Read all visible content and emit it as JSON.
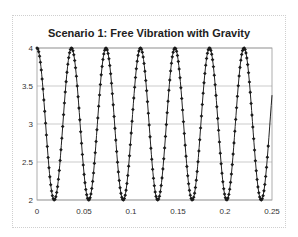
{
  "chart_data": {
    "type": "line",
    "title": "Scenario 1: Free Vibration with Gravity",
    "xlabel": "",
    "ylabel": "",
    "xlim": [
      0,
      0.25
    ],
    "ylim": [
      2,
      4
    ],
    "x_ticks": [
      "0",
      "0.05",
      "0.1",
      "0.15",
      "0.2",
      "0.25"
    ],
    "y_ticks": [
      "2",
      "2.5",
      "3",
      "3.5",
      "4"
    ],
    "grid": {
      "horizontal": true,
      "vertical": false
    },
    "legend": null,
    "series": [
      {
        "name": "displacement",
        "marker": "diamond",
        "color": "#1a1a1a",
        "model": "y = 3 + cos(2*pi*t/T)",
        "mean": 3,
        "amplitude": 1,
        "period": 0.0367,
        "t_start": 0,
        "t_end": 0.25,
        "y_at_end": 3.68,
        "peaks_t": [
          0,
          0.0367,
          0.0734,
          0.1101,
          0.1468,
          0.1835,
          0.2202
        ],
        "troughs_t": [
          0.0184,
          0.0551,
          0.0918,
          0.1285,
          0.1652,
          0.2019,
          0.2386
        ]
      }
    ]
  }
}
